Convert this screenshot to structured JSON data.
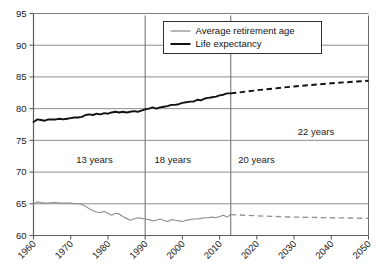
{
  "chart_data": {
    "type": "line",
    "title": "",
    "subtitle": "",
    "xlabel": "",
    "ylabel": "",
    "xlim": [
      1960,
      2050
    ],
    "ylim": [
      60,
      95
    ],
    "grid": true,
    "legend_position": "top-right",
    "y_ticks": [
      "60",
      "65",
      "70",
      "75",
      "80",
      "85",
      "90",
      "95"
    ],
    "y_tick_values": [
      60,
      65,
      70,
      75,
      80,
      85,
      90,
      95
    ],
    "x_ticks": [
      "1960",
      "1970",
      "1980",
      "1990",
      "2000",
      "2010",
      "2020",
      "2030",
      "2040",
      "2050"
    ],
    "x_tick_values": [
      1960,
      1970,
      1980,
      1990,
      2000,
      2010,
      2020,
      2030,
      2040,
      2050
    ],
    "series": [
      {
        "name": "Average retirement age",
        "color": "#909090",
        "style": "solid",
        "x": [
          1960,
          1961,
          1962,
          1963,
          1964,
          1965,
          1966,
          1967,
          1968,
          1969,
          1970,
          1971,
          1972,
          1973,
          1974,
          1975,
          1976,
          1977,
          1978,
          1979,
          1980,
          1981,
          1982,
          1983,
          1984,
          1985,
          1986,
          1987,
          1988,
          1989,
          1990,
          1991,
          1992,
          1993,
          1994,
          1995,
          1996,
          1997,
          1998,
          1999,
          2000,
          2001,
          2002,
          2003,
          2004,
          2005,
          2006,
          2007,
          2008,
          2009,
          2010,
          2011,
          2012,
          2013
        ],
        "values": [
          64.9,
          65.3,
          65.2,
          65.1,
          65.1,
          65.2,
          65.2,
          65.1,
          65.1,
          65.1,
          65.1,
          65.0,
          65.0,
          64.9,
          64.6,
          64.2,
          63.9,
          63.7,
          63.6,
          63.8,
          63.5,
          63.2,
          63.5,
          63.4,
          63.0,
          62.7,
          62.4,
          62.6,
          62.8,
          62.7,
          62.6,
          62.5,
          62.3,
          62.4,
          62.6,
          62.4,
          62.2,
          62.5,
          62.4,
          62.3,
          62.2,
          62.4,
          62.5,
          62.6,
          62.6,
          62.7,
          62.8,
          62.8,
          62.9,
          62.8,
          63.0,
          63.2,
          62.9,
          63.3
        ]
      },
      {
        "name": "Average retirement age",
        "series_role": "projection",
        "color": "#909090",
        "style": "dashed",
        "x": [
          2013,
          2020,
          2030,
          2040,
          2050
        ],
        "values": [
          63.3,
          63.1,
          62.9,
          62.8,
          62.7
        ]
      },
      {
        "name": "Life expectancy",
        "color": "#111111",
        "style": "solid",
        "x": [
          1960,
          1961,
          1962,
          1963,
          1964,
          1965,
          1966,
          1967,
          1968,
          1969,
          1970,
          1971,
          1972,
          1973,
          1974,
          1975,
          1976,
          1977,
          1978,
          1979,
          1980,
          1981,
          1982,
          1983,
          1984,
          1985,
          1986,
          1987,
          1988,
          1989,
          1990,
          1991,
          1992,
          1993,
          1994,
          1995,
          1996,
          1997,
          1998,
          1999,
          2000,
          2001,
          2002,
          2003,
          2004,
          2005,
          2006,
          2007,
          2008,
          2009,
          2010,
          2011,
          2012,
          2013
        ],
        "values": [
          77.9,
          78.3,
          78.2,
          78.1,
          78.3,
          78.3,
          78.3,
          78.4,
          78.3,
          78.4,
          78.5,
          78.6,
          78.6,
          78.7,
          79.0,
          79.1,
          79.0,
          79.2,
          79.1,
          79.3,
          79.2,
          79.4,
          79.5,
          79.4,
          79.5,
          79.4,
          79.5,
          79.6,
          79.5,
          79.7,
          79.9,
          80.0,
          80.2,
          80.0,
          80.2,
          80.3,
          80.4,
          80.6,
          80.6,
          80.7,
          80.9,
          81.0,
          81.1,
          81.1,
          81.4,
          81.3,
          81.6,
          81.7,
          81.8,
          81.9,
          82.1,
          82.2,
          82.4,
          82.4
        ]
      },
      {
        "name": "Life expectancy",
        "series_role": "projection",
        "color": "#111111",
        "style": "dashed",
        "x": [
          2013,
          2020,
          2030,
          2040,
          2050
        ],
        "values": [
          82.4,
          82.9,
          83.5,
          84.0,
          84.4
        ]
      }
    ],
    "annotations": [
      {
        "label": "13 years",
        "x": 1971.5,
        "y": 71.4
      },
      {
        "label": "18 years",
        "x": 1992.5,
        "y": 71.4
      },
      {
        "label": "20 years",
        "x": 2015.0,
        "y": 71.4
      },
      {
        "label": "22 years",
        "x": 2031.0,
        "y": 75.9
      }
    ],
    "gap_markers": [
      {
        "x": 1960
      },
      {
        "x": 1990
      },
      {
        "x": 2013
      },
      {
        "x": 2050
      }
    ]
  },
  "legend": {
    "items": [
      {
        "label": "Average retirement age",
        "color": "#909090"
      },
      {
        "label": "Life expectancy",
        "color": "#111111"
      }
    ]
  }
}
